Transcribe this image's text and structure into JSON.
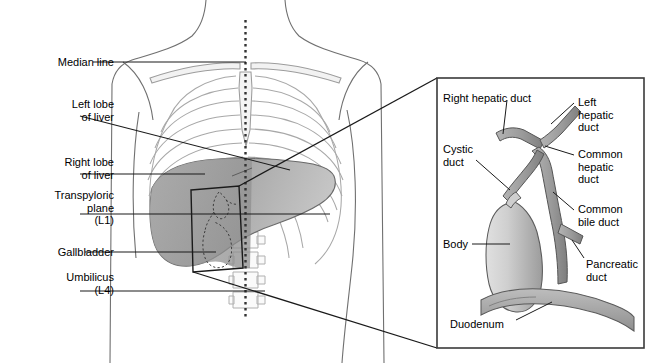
{
  "figure": {
    "colors": {
      "outline": "#4a4a4a",
      "bone": "#9a9a9a",
      "liver_dark": "#8c8c8c",
      "liver_light": "#c3c3c3",
      "duct": "#9b9b9b",
      "duct_edge": "#555555",
      "gallbladder_light": "#d6d6d6",
      "gallbladder_dark": "#a2a2a2",
      "duodenum": "#a8a8a8",
      "leader": "#1a1a1a",
      "panel_border": "#3a3a3a",
      "median_dots": "#3a3a3a"
    },
    "left_labels": [
      {
        "id": "median-line",
        "text": "Median line",
        "x": 18,
        "y": 56,
        "w": 96,
        "align": "right"
      },
      {
        "id": "left-lobe",
        "text": "Left lobe\nof liver",
        "x": 18,
        "y": 98,
        "w": 96,
        "align": "right"
      },
      {
        "id": "right-lobe",
        "text": "Right lobe\nof liver",
        "x": 18,
        "y": 156,
        "w": 96,
        "align": "right"
      },
      {
        "id": "transpyloric",
        "text": "Transpyloric\nplane\n(L1)",
        "x": 8,
        "y": 189,
        "w": 106,
        "align": "right"
      },
      {
        "id": "gallbladder",
        "text": "Gallbladder",
        "x": 18,
        "y": 246,
        "w": 96,
        "align": "right"
      },
      {
        "id": "umbilicus",
        "text": "Umbilicus\n(L4)",
        "x": 18,
        "y": 271,
        "w": 96,
        "align": "right"
      }
    ],
    "panel_labels": [
      {
        "id": "right-hepatic-duct",
        "text": "Right hepatic duct",
        "x": 443,
        "y": 92,
        "align": "left"
      },
      {
        "id": "left-hepatic-duct",
        "text": "Left\nhepatic\nduct",
        "x": 578,
        "y": 96,
        "align": "left"
      },
      {
        "id": "cystic-duct",
        "text": "Cystic\nduct",
        "x": 443,
        "y": 143,
        "align": "left"
      },
      {
        "id": "common-hepatic-duct",
        "text": "Common\nhepatic\nduct",
        "x": 578,
        "y": 148,
        "align": "left"
      },
      {
        "id": "common-bile-duct",
        "text": "Common\nbile duct",
        "x": 578,
        "y": 203,
        "align": "left"
      },
      {
        "id": "body",
        "text": "Body",
        "x": 443,
        "y": 238,
        "align": "left"
      },
      {
        "id": "pancreatic-duct",
        "text": "Pancreatic\nduct",
        "x": 586,
        "y": 258,
        "align": "left"
      },
      {
        "id": "duodenum",
        "text": "Duodenum",
        "x": 450,
        "y": 318,
        "align": "left"
      }
    ],
    "panel": {
      "x": 437,
      "y": 78,
      "w": 207,
      "h": 270
    }
  }
}
